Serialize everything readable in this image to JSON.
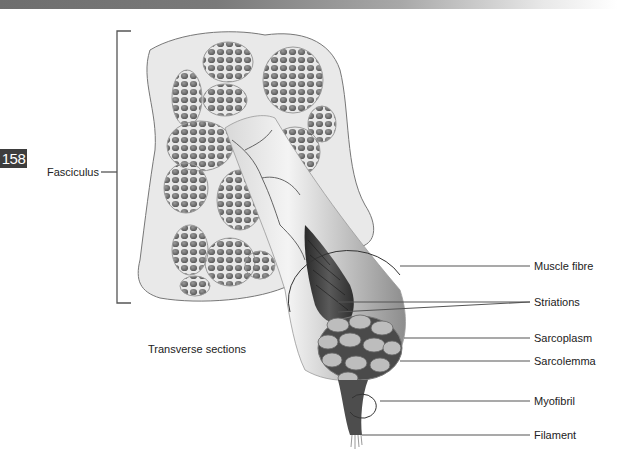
{
  "page": {
    "number": "158"
  },
  "diagram": {
    "left_labels": {
      "fasciculus": "Fasciculus",
      "transverse_sections": "Transverse sections"
    },
    "right_labels": [
      {
        "id": "muscle-fibre",
        "text": "Muscle fibre"
      },
      {
        "id": "striations",
        "text": "Striations"
      },
      {
        "id": "sarcoplasm",
        "text": "Sarcoplasm"
      },
      {
        "id": "sarcolemma",
        "text": "Sarcolemma"
      },
      {
        "id": "myofibril",
        "text": "Myofibril"
      },
      {
        "id": "filament",
        "text": "Filament"
      }
    ]
  },
  "colors": {
    "header_gradient_start": "#6e6e6e",
    "badge_bg": "#3d3d3d",
    "leader_line": "#555555",
    "fibre_fill": "#7c7c7c",
    "section_bg": "#e6e6e6"
  }
}
